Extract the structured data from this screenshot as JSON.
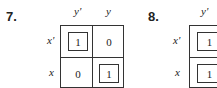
{
  "problems": [
    {
      "number": "7.",
      "col_labels": [
        "y'",
        "y"
      ],
      "row_labels": [
        "x'",
        "x"
      ],
      "cells": [
        [
          "1",
          "0"
        ],
        [
          "0",
          "1"
        ]
      ],
      "boxed": [
        [
          true,
          false
        ],
        [
          false,
          true
        ]
      ]
    },
    {
      "number": "8.",
      "col_labels": [
        "y'"
      ],
      "row_labels": [
        "x'",
        "x"
      ],
      "cells": [
        [
          "1"
        ],
        [
          "1"
        ]
      ],
      "boxed": [
        [
          true
        ],
        [
          true
        ]
      ]
    }
  ]
}
